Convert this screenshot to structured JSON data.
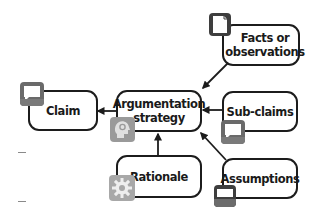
{
  "diagram": {
    "nodes": {
      "facts": {
        "label": "Facts or\nobservations",
        "icon": "document-icon"
      },
      "claim": {
        "label": "Claim",
        "icon": "speech-bubble-icon"
      },
      "strategy": {
        "label": "Argumentation\nstrategy",
        "icon": "head-gear-icon"
      },
      "subclaims": {
        "label": "Sub-claims",
        "icon": "speech-bubble-icon"
      },
      "rationale": {
        "label": "Rationale",
        "icon": "gear-icon"
      },
      "assumptions": {
        "label": "Assumptions",
        "icon": "monitor-icon"
      }
    },
    "edges": [
      {
        "from": "Facts or observations",
        "to": "Argumentation strategy"
      },
      {
        "from": "Sub-claims",
        "to": "Argumentation strategy"
      },
      {
        "from": "Assumptions",
        "to": "Argumentation strategy"
      },
      {
        "from": "Rationale",
        "to": "Argumentation strategy"
      },
      {
        "from": "Argumentation strategy",
        "to": "Claim"
      }
    ],
    "colors": {
      "stroke": "#1c1c1c",
      "icon_dark": "#4a4a4a",
      "icon_mid": "#8c8c8c",
      "icon_light": "#d6d6d6"
    }
  }
}
